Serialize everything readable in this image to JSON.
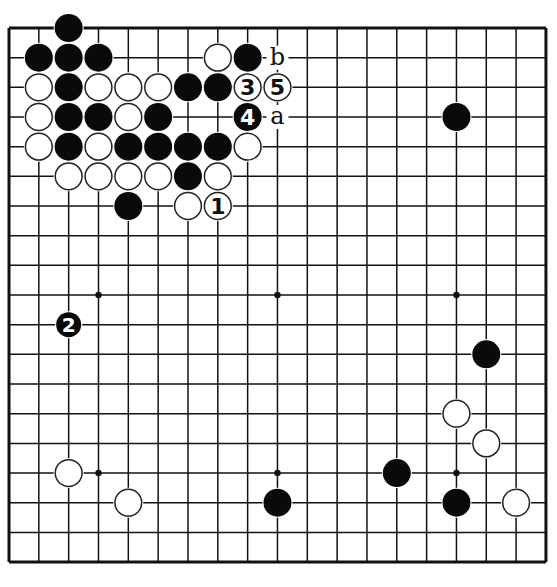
{
  "board": {
    "size": 19,
    "origin_x": 9,
    "origin_y": 28,
    "spacing_x": 29.83,
    "spacing_y": 29.67,
    "stone_radius": 14,
    "colors": {
      "background": "#ffffff",
      "line": "#111111",
      "black_stone": "#0a0a0a",
      "white_stone": "#ffffff",
      "white_outline": "#222222"
    },
    "star_points": [
      [
        3,
        3
      ],
      [
        9,
        3
      ],
      [
        15,
        3
      ],
      [
        3,
        9
      ],
      [
        9,
        9
      ],
      [
        15,
        9
      ],
      [
        3,
        15
      ],
      [
        9,
        15
      ],
      [
        15,
        15
      ]
    ]
  },
  "stones": [
    {
      "color": "black",
      "col": 2,
      "row": 0
    },
    {
      "color": "black",
      "col": 1,
      "row": 1
    },
    {
      "color": "black",
      "col": 2,
      "row": 1
    },
    {
      "color": "black",
      "col": 3,
      "row": 1
    },
    {
      "color": "white",
      "col": 7,
      "row": 1
    },
    {
      "color": "black",
      "col": 8,
      "row": 1
    },
    {
      "color": "white",
      "col": 1,
      "row": 2
    },
    {
      "color": "black",
      "col": 2,
      "row": 2
    },
    {
      "color": "white",
      "col": 3,
      "row": 2
    },
    {
      "color": "white",
      "col": 4,
      "row": 2
    },
    {
      "color": "white",
      "col": 5,
      "row": 2
    },
    {
      "color": "black",
      "col": 6,
      "row": 2
    },
    {
      "color": "black",
      "col": 7,
      "row": 2
    },
    {
      "color": "white",
      "col": 8,
      "row": 2,
      "number": "3"
    },
    {
      "color": "white",
      "col": 9,
      "row": 2,
      "number": "5"
    },
    {
      "color": "white",
      "col": 1,
      "row": 3
    },
    {
      "color": "black",
      "col": 2,
      "row": 3
    },
    {
      "color": "black",
      "col": 3,
      "row": 3
    },
    {
      "color": "white",
      "col": 4,
      "row": 3
    },
    {
      "color": "black",
      "col": 5,
      "row": 3
    },
    {
      "color": "black",
      "col": 8,
      "row": 3,
      "number": "4"
    },
    {
      "color": "black",
      "col": 15,
      "row": 3
    },
    {
      "color": "white",
      "col": 1,
      "row": 4
    },
    {
      "color": "black",
      "col": 2,
      "row": 4
    },
    {
      "color": "white",
      "col": 3,
      "row": 4
    },
    {
      "color": "black",
      "col": 4,
      "row": 4
    },
    {
      "color": "black",
      "col": 5,
      "row": 4
    },
    {
      "color": "black",
      "col": 6,
      "row": 4
    },
    {
      "color": "black",
      "col": 7,
      "row": 4
    },
    {
      "color": "white",
      "col": 8,
      "row": 4
    },
    {
      "color": "white",
      "col": 2,
      "row": 5
    },
    {
      "color": "white",
      "col": 3,
      "row": 5
    },
    {
      "color": "white",
      "col": 4,
      "row": 5
    },
    {
      "color": "white",
      "col": 5,
      "row": 5
    },
    {
      "color": "black",
      "col": 6,
      "row": 5
    },
    {
      "color": "white",
      "col": 7,
      "row": 5
    },
    {
      "color": "black",
      "col": 4,
      "row": 6
    },
    {
      "color": "white",
      "col": 6,
      "row": 6
    },
    {
      "color": "white",
      "col": 7,
      "row": 6,
      "number": "1"
    },
    {
      "color": "black",
      "col": 2,
      "row": 10,
      "number": "2",
      "small": true
    },
    {
      "color": "black",
      "col": 16,
      "row": 11
    },
    {
      "color": "white",
      "col": 15,
      "row": 13
    },
    {
      "color": "white",
      "col": 16,
      "row": 14
    },
    {
      "color": "white",
      "col": 2,
      "row": 15
    },
    {
      "color": "black",
      "col": 13,
      "row": 15
    },
    {
      "color": "white",
      "col": 4,
      "row": 16
    },
    {
      "color": "black",
      "col": 9,
      "row": 16
    },
    {
      "color": "black",
      "col": 15,
      "row": 16
    },
    {
      "color": "white",
      "col": 17,
      "row": 16
    }
  ],
  "labels": [
    {
      "text": "b",
      "col": 9,
      "row": 1
    },
    {
      "text": "a",
      "col": 9,
      "row": 3
    }
  ]
}
